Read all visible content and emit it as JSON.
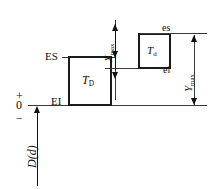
{
  "figure": {
    "axis": {
      "plus_label": "+",
      "zero_label": "0",
      "minus_label": "−",
      "deviation_label": "D(d)",
      "deviation_label_plain": "D(d)"
    },
    "hole_box": {
      "inner_label_main": "T",
      "inner_label_sub": "D",
      "upper_dev_label": "ES",
      "lower_dev_label": "EI"
    },
    "shaft_box": {
      "inner_label_main": "T",
      "inner_label_sub": "d",
      "upper_dev_label": "es",
      "lower_dev_label": "ei"
    },
    "dimensions": {
      "x_main": "X",
      "x_sub": "max",
      "y_main": "Y",
      "y_sub": "max"
    },
    "colors": {
      "line": "#3a3a3a",
      "box_stroke": "#1a1a1a",
      "text": "#111111",
      "background": "#ffffff"
    }
  }
}
